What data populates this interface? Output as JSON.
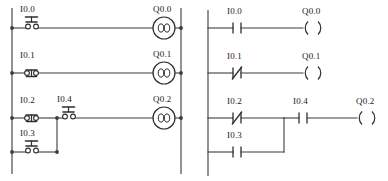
{
  "diagram": {
    "panels": [
      {
        "id": "schematic",
        "name": "electrical-schematic",
        "type": "relay-schematic"
      },
      {
        "id": "ladder",
        "name": "ladder-logic-diagram",
        "type": "ladder-diagram"
      }
    ]
  },
  "schematic": {
    "rungs": [
      {
        "index": 0,
        "inputs": [
          {
            "label": "I0.0",
            "symbol": "pushbutton-no",
            "icon": "pushbutton-no-icon"
          }
        ],
        "output": {
          "label": "Q0.0",
          "symbol": "relay-coil",
          "icon": "relay-coil-icon"
        }
      },
      {
        "index": 1,
        "inputs": [
          {
            "label": "I0.1",
            "symbol": "pushbutton-nc",
            "icon": "pushbutton-nc-icon"
          }
        ],
        "output": {
          "label": "Q0.1",
          "symbol": "relay-coil",
          "icon": "relay-coil-icon"
        }
      },
      {
        "index": 2,
        "inputs": [
          {
            "label": "I0.2",
            "symbol": "pushbutton-nc",
            "icon": "pushbutton-nc-icon"
          },
          {
            "label": "I0.3",
            "symbol": "pushbutton-no",
            "icon": "pushbutton-no-icon"
          },
          {
            "label": "I0.4",
            "symbol": "pushbutton-no",
            "icon": "pushbutton-no-icon"
          }
        ],
        "output": {
          "label": "Q0.2",
          "symbol": "relay-coil",
          "icon": "relay-coil-icon"
        }
      }
    ]
  },
  "ladder": {
    "rungs": [
      {
        "index": 0,
        "contacts": [
          {
            "label": "I0.0",
            "type": "normally-open",
            "glyph": "-| |-"
          }
        ],
        "coil": {
          "label": "Q0.0",
          "glyph": "-( )"
        }
      },
      {
        "index": 1,
        "contacts": [
          {
            "label": "I0.1",
            "type": "normally-closed",
            "glyph": "-|/|-"
          }
        ],
        "coil": {
          "label": "Q0.1",
          "glyph": "-( )"
        }
      },
      {
        "index": 2,
        "contacts": [
          {
            "label": "I0.2",
            "type": "normally-closed",
            "glyph": "-|/|-"
          },
          {
            "label": "I0.3",
            "type": "normally-open",
            "glyph": "-| |-"
          },
          {
            "label": "I0.4",
            "type": "normally-open",
            "glyph": "-| |-"
          }
        ],
        "coil": {
          "label": "Q0.2",
          "glyph": "-( )"
        }
      }
    ]
  },
  "colors": {
    "line": "#3c3c3c",
    "symbol": "#2e2e2e",
    "text": "#1a1a1a",
    "background": "#ffffff"
  }
}
